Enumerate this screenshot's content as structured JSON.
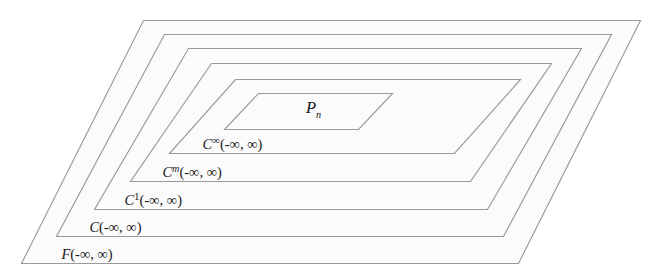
{
  "figure": {
    "name": "nested-function-spaces-diagram",
    "background_color": "#ffffff",
    "shape_fill_color": "#fbfbfb",
    "shape_stroke_color": "#9a9a9a",
    "text_color": "#17171a",
    "interval_text": "(-∞, ∞)",
    "minus_infinity": "-∞",
    "plus_infinity": "∞"
  },
  "layers": [
    {
      "id": "F",
      "label_base": "F",
      "label_superscript": "",
      "label_subscript": "",
      "label_argument": "(-∞, ∞)",
      "label_full": "F(-∞, ∞)",
      "label_x": 36,
      "label_y": 259,
      "points": "143.5,20.5 640.5,20.5 518.5,263.5 21.5,263.5"
    },
    {
      "id": "C",
      "label_base": "C",
      "label_superscript": "",
      "label_subscript": "",
      "label_argument": "(-∞, ∞)",
      "label_full": "C(-∞, ∞)",
      "label_x": 64,
      "label_y": 232,
      "points": "164.5,34.5 611.5,34.5 503.5,236.5 56.5,236.5"
    },
    {
      "id": "C1",
      "label_base": "C",
      "label_superscript": "1",
      "label_subscript": "",
      "label_argument": "(-∞, ∞)",
      "label_full": "C¹(-∞, ∞)",
      "label_x": 99,
      "label_y": 205,
      "points": "188.5,48.5 581.5,48.5 487.5,209.5 94.5,209.5"
    },
    {
      "id": "Cm",
      "label_base": "C",
      "label_superscript": "m",
      "label_subscript": "",
      "label_argument": "(-∞, ∞)",
      "label_full": "Cᵐ(-∞, ∞)",
      "label_x": 137,
      "label_y": 177,
      "points": "211.5,63.5 551.5,63.5 470.5,181.5 130.5,181.5"
    },
    {
      "id": "Cinf",
      "label_base": "C",
      "label_superscript": "∞",
      "label_subscript": "",
      "label_argument": "(-∞, ∞)",
      "label_full": "C∞(-∞, ∞)",
      "label_x": 177,
      "label_y": 149,
      "points": "235.5,79.5 520.5,79.5 454.5,153.5 169.5,153.5"
    },
    {
      "id": "Pn",
      "label_base": "P",
      "label_superscript": "",
      "label_subscript": "n",
      "label_argument": "",
      "label_full": "Pₙ",
      "label_x": 277,
      "label_y": 113,
      "points": "258.5,93.5 392.5,93.5 358.5,129.5 224.5,129.5"
    }
  ]
}
